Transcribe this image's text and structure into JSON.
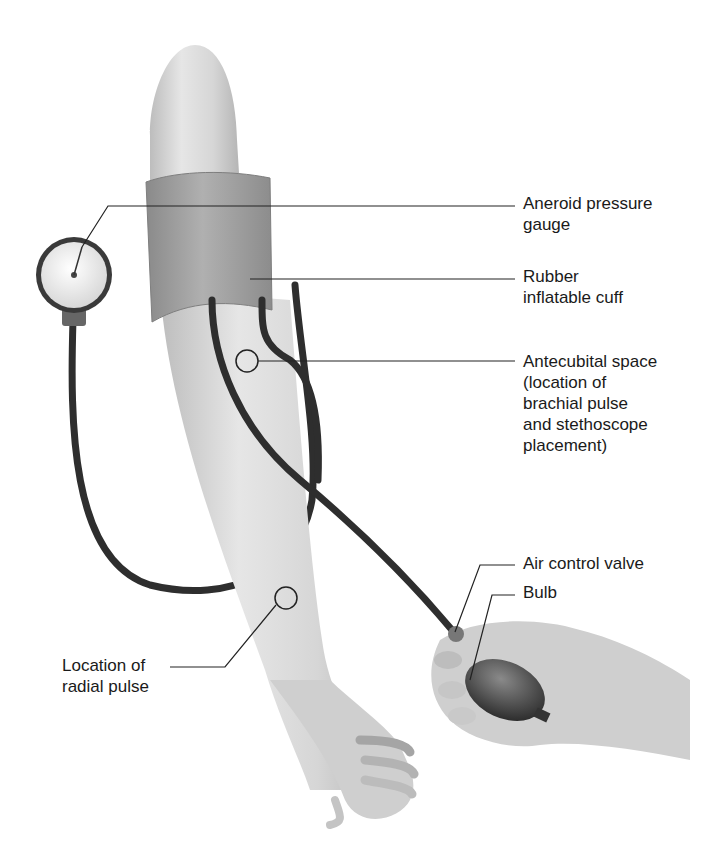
{
  "diagram": {
    "colors": {
      "skin_light": "#e4e4e4",
      "skin_mid": "#cfcfcf",
      "skin_dark": "#a9a9a9",
      "cuff": "#9c9c9c",
      "cuff_dark": "#7e7e7e",
      "tube": "#2e2e2e",
      "leader": "#222222",
      "text": "#1a1a1a"
    },
    "labels": [
      {
        "id": "aneroid-pressure-gauge",
        "text": "Aneroid pressure\ngauge",
        "x": 523,
        "y": 193
      },
      {
        "id": "rubber-inflatable-cuff",
        "text": "Rubber\ninflatable cuff",
        "x": 523,
        "y": 264
      },
      {
        "id": "antecubital-space",
        "text": "Antecubital space\n(location of\nbrachial pulse\nand stethoscope\nplacement)",
        "x": 523,
        "y": 351
      },
      {
        "id": "air-control-valve",
        "text": "Air control valve",
        "x": 523,
        "y": 552
      },
      {
        "id": "bulb",
        "text": "Bulb",
        "x": 523,
        "y": 581
      },
      {
        "id": "radial-pulse",
        "text": "Location of\nradial pulse",
        "x": 62,
        "y": 653
      }
    ]
  }
}
